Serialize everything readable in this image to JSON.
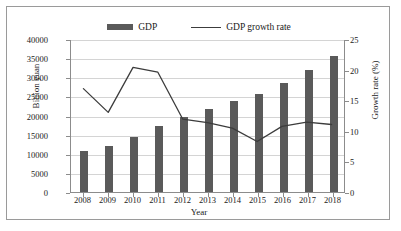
{
  "chart_data": {
    "type": "bar",
    "title": "",
    "xlabel": "Year",
    "ylabel": "Billion yuan",
    "y2label": "Growth rate (%)",
    "categories": [
      "2008",
      "2009",
      "2010",
      "2011",
      "2012",
      "2013",
      "2014",
      "2015",
      "2016",
      "2017",
      "2018"
    ],
    "ylim": [
      0,
      40000
    ],
    "yticks": [
      "0",
      "5000",
      "10000",
      "15000",
      "20000",
      "25000",
      "30000",
      "35000",
      "40000"
    ],
    "y2lim": [
      0,
      25
    ],
    "y2ticks": [
      "0",
      "5",
      "10",
      "15",
      "20",
      "25"
    ],
    "grid": true,
    "legend_position": "top-center",
    "series": [
      {
        "name": "GDP",
        "type": "bar",
        "axis": "left",
        "unit": "Billion yuan",
        "color": "#5a5a5a",
        "values": [
          10600,
          12100,
          14500,
          17300,
          19500,
          21700,
          23900,
          25700,
          28600,
          31900,
          35500
        ]
      },
      {
        "name": "GDP growth rate",
        "type": "line",
        "axis": "right",
        "unit": "%",
        "color": "#3c3c3c",
        "values": [
          17.0,
          13.1,
          20.5,
          19.7,
          12.0,
          11.4,
          10.5,
          8.3,
          10.8,
          11.5,
          11.1
        ]
      }
    ]
  }
}
